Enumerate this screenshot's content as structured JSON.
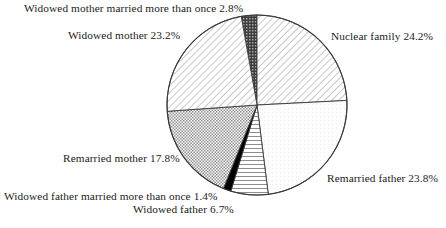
{
  "chart_data": {
    "type": "pie",
    "title": "",
    "subtitle": "",
    "xlabel": "",
    "ylabel": "",
    "legend_position": "outside-labels",
    "grid": false,
    "units": "percent",
    "categories": [
      "Widowed mother married more than once",
      "Nuclear family",
      "Remarried father",
      "Widowed father",
      "Widowed father married more than once",
      "Remarried mother",
      "Widowed mother"
    ],
    "values": [
      2.8,
      24.2,
      23.8,
      6.7,
      1.4,
      17.8,
      23.2
    ],
    "slices": [
      {
        "label": "Widowed mother married more than once",
        "value": 2.8,
        "label_text": "Widowed mother married more than once 2.8%",
        "fill": "dark-checker",
        "start_angle": -10.1,
        "end_angle": 0.0
      },
      {
        "label": "Nuclear family",
        "value": 24.2,
        "label_text": "Nuclear family 24.2%",
        "fill": "diagonal-hatch",
        "start_angle": 0.0,
        "end_angle": 87.1
      },
      {
        "label": "Remarried father",
        "value": 23.8,
        "label_text": "Remarried father 23.8%",
        "fill": "very-light",
        "start_angle": 87.1,
        "end_angle": 172.8
      },
      {
        "label": "Widowed father",
        "value": 6.7,
        "label_text": "Widowed father 6.7%",
        "fill": "horizontal-lines",
        "start_angle": 172.8,
        "end_angle": 196.9
      },
      {
        "label": "Widowed father married more than once",
        "value": 1.4,
        "label_text": "Widowed father married more than once 1.4%",
        "fill": "solid-black",
        "start_angle": 196.9,
        "end_angle": 201.9
      },
      {
        "label": "Remarried mother",
        "value": 17.8,
        "label_text": "Remarried mother 17.8%",
        "fill": "dotted-checker",
        "start_angle": 201.9,
        "end_angle": 266.0
      },
      {
        "label": "Widowed mother",
        "value": 23.2,
        "label_text": "Widowed mother 23.2%",
        "fill": "diagonal-hatch",
        "start_angle": 266.0,
        "end_angle": 349.9
      }
    ],
    "colors": {
      "outline": "#3a3a3a",
      "solid_black": "#000000",
      "dark_checker": "#4a4a4a",
      "light_fill": "#fbfbfb",
      "hatch_line": "#9a9a9a",
      "dot": "#8f8f8f",
      "text": "#1b1b1b"
    },
    "geometry": {
      "center_x": 257,
      "center_y": 105,
      "radius": 90
    }
  },
  "labels": {
    "widowed_mother_married_more_than_once": "Widowed mother married more than once 2.8%",
    "widowed_mother": "Widowed mother 23.2%",
    "nuclear_family": "Nuclear family 24.2%",
    "remarried_father": "Remarried father 23.8%",
    "remarried_mother": "Remarried mother 17.8%",
    "widowed_father_married_more_than_once": "Widowed father married more than once 1.4%",
    "widowed_father": "Widowed father 6.7%"
  }
}
